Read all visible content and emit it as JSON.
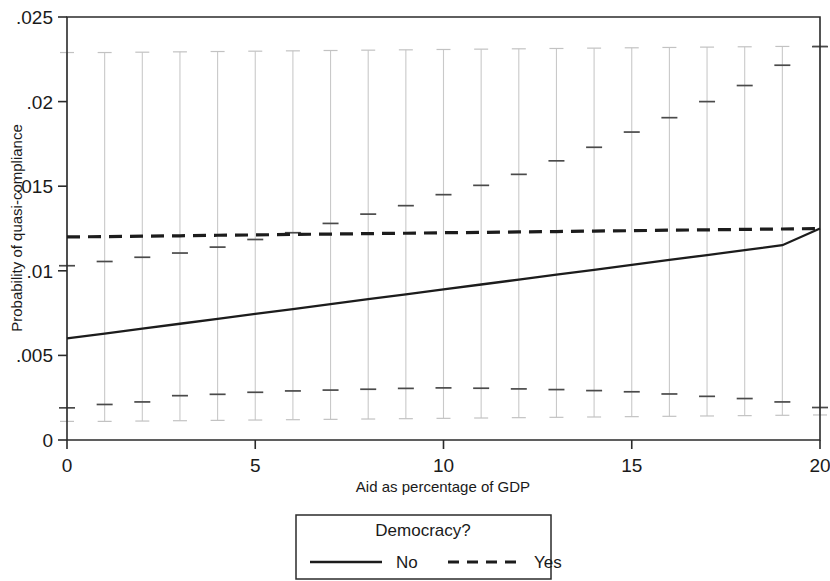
{
  "chart_data": {
    "type": "line",
    "title": "",
    "xlabel": "Aid as percentage of GDP",
    "ylabel": "Probability of quasi-compliance",
    "xlim": [
      0,
      20
    ],
    "ylim": [
      0,
      0.025
    ],
    "grid": false,
    "legend_position": "below",
    "legend_title": "Democracy?",
    "xticks": [
      0,
      5,
      10,
      15,
      20
    ],
    "xticklabels": [
      "0",
      "5",
      "10",
      "15",
      "20"
    ],
    "yticks": [
      0,
      0.005,
      0.01,
      0.015,
      0.02,
      0.025
    ],
    "yticklabels": [
      "0",
      ".005",
      ".01",
      ".015",
      ".02",
      ".025"
    ],
    "x": [
      0,
      1,
      2,
      3,
      4,
      5,
      6,
      7,
      8,
      9,
      10,
      11,
      12,
      13,
      14,
      15,
      16,
      17,
      18,
      19,
      20
    ],
    "series": [
      {
        "name": "No",
        "style": "solid",
        "color": "#1c1c1c",
        "values": [
          0.006,
          0.00629,
          0.00658,
          0.00687,
          0.00716,
          0.00745,
          0.00774,
          0.00803,
          0.00832,
          0.00861,
          0.0089,
          0.00919,
          0.00948,
          0.00977,
          0.01006,
          0.01035,
          0.01064,
          0.01093,
          0.01122,
          0.01151,
          0.0125
        ]
      },
      {
        "name": "Yes",
        "style": "dashed",
        "color": "#1c1c1c",
        "values": [
          0.012,
          0.01202,
          0.01205,
          0.01207,
          0.0121,
          0.01212,
          0.01215,
          0.01217,
          0.0122,
          0.01222,
          0.01225,
          0.01227,
          0.0123,
          0.01232,
          0.01235,
          0.01237,
          0.0124,
          0.01242,
          0.01245,
          0.01247,
          0.0125
        ]
      }
    ],
    "error_bars": {
      "description": "Vertical confidence interval whiskers at each integer aid level, with interior tick marks marking the two series' interval bounds.",
      "upper_cap": [
        0.0229,
        0.0229,
        0.02292,
        0.02294,
        0.02296,
        0.02298,
        0.023,
        0.02302,
        0.02304,
        0.02306,
        0.02308,
        0.0231,
        0.02312,
        0.02314,
        0.02316,
        0.02318,
        0.0232,
        0.02322,
        0.02324,
        0.02326,
        0.02328
      ],
      "lower_cap": [
        0.0011,
        0.0011,
        0.00112,
        0.00114,
        0.00116,
        0.00118,
        0.0012,
        0.00122,
        0.00124,
        0.00126,
        0.00128,
        0.0013,
        0.00132,
        0.00134,
        0.00136,
        0.00138,
        0.0014,
        0.00142,
        0.00144,
        0.00146,
        0.00148
      ],
      "upper_ci_tick": [
        0.0103,
        0.01055,
        0.0108,
        0.01105,
        0.0114,
        0.01185,
        0.01225,
        0.0128,
        0.01335,
        0.01385,
        0.0145,
        0.01505,
        0.0157,
        0.0165,
        0.0173,
        0.0182,
        0.01905,
        0.02,
        0.02095,
        0.02215,
        0.02325
      ],
      "lower_ci_tick": [
        0.0019,
        0.0021,
        0.00225,
        0.00262,
        0.0027,
        0.00282,
        0.0029,
        0.00295,
        0.003,
        0.00305,
        0.00308,
        0.00306,
        0.00302,
        0.00298,
        0.00292,
        0.00285,
        0.00272,
        0.00258,
        0.00245,
        0.00225,
        0.00192
      ]
    },
    "legend_entries": [
      {
        "label": "No",
        "style": "solid"
      },
      {
        "label": "Yes",
        "style": "dashed"
      }
    ]
  }
}
